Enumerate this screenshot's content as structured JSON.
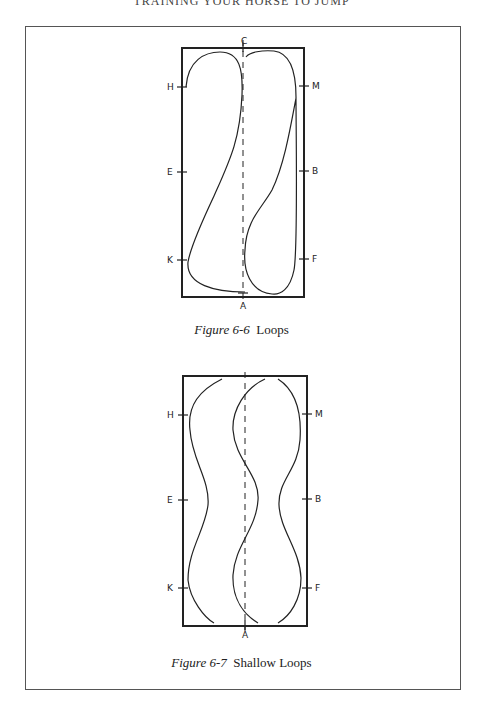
{
  "page": {
    "running_header": "TRAINING YOUR HORSE TO JUMP"
  },
  "figures": [
    {
      "number": "Figure 6-6",
      "title": "Loops",
      "markers": {
        "top": "C",
        "bottom": "A",
        "left": [
          "H",
          "E",
          "K"
        ],
        "right": [
          "M",
          "B",
          "F"
        ]
      }
    },
    {
      "number": "Figure 6-7",
      "title": "Shallow Loops",
      "markers": {
        "bottom": "A",
        "left": [
          "H",
          "E",
          "K"
        ],
        "right": [
          "M",
          "B",
          "F"
        ]
      }
    }
  ]
}
